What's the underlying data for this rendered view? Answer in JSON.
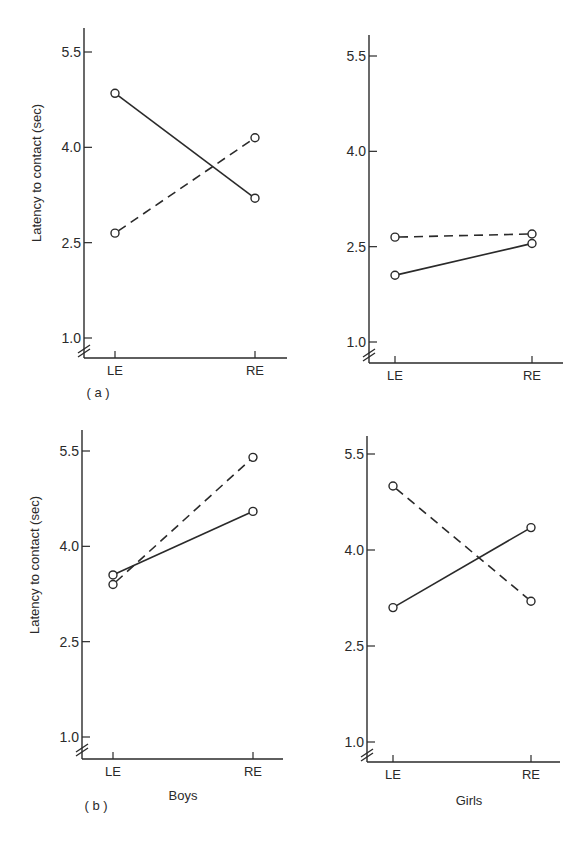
{
  "figure": {
    "panel_labels": {
      "a": "( a )",
      "b": "( b )"
    },
    "y_axis_title": "Latency to contact (sec)",
    "group_labels": {
      "boys": "Boys",
      "girls": "Girls"
    },
    "line_color": "#2a2a2a"
  },
  "chart_data": [
    {
      "id": "a-boys",
      "type": "line",
      "row": "a",
      "column": "Boys",
      "categories": [
        "LE",
        "RE"
      ],
      "yticks": [
        "1.0",
        "2.5",
        "4.0",
        "5.5"
      ],
      "ylim": [
        1.0,
        5.5
      ],
      "y_axis_break": true,
      "ylabel": "Latency to contact (sec)",
      "xlabel": "",
      "series": [
        {
          "name": "solid",
          "style": "solid",
          "marker": "open-circle",
          "values": [
            4.85,
            3.2
          ]
        },
        {
          "name": "dashed",
          "style": "dashed",
          "marker": "open-circle",
          "values": [
            2.65,
            4.15
          ]
        }
      ]
    },
    {
      "id": "a-girls",
      "type": "line",
      "row": "a",
      "column": "Girls",
      "categories": [
        "LE",
        "RE"
      ],
      "yticks": [
        "1.0",
        "2.5",
        "4.0",
        "5.5"
      ],
      "ylim": [
        1.0,
        5.5
      ],
      "y_axis_break": true,
      "ylabel": "",
      "xlabel": "",
      "series": [
        {
          "name": "solid",
          "style": "solid",
          "marker": "open-circle",
          "values": [
            2.05,
            2.55
          ]
        },
        {
          "name": "dashed",
          "style": "dashed",
          "marker": "open-circle",
          "values": [
            2.65,
            2.7
          ]
        }
      ]
    },
    {
      "id": "b-boys",
      "type": "line",
      "row": "b",
      "column": "Boys",
      "categories": [
        "LE",
        "RE"
      ],
      "yticks": [
        "1.0",
        "2.5",
        "4.0",
        "5.5"
      ],
      "ylim": [
        1.0,
        5.5
      ],
      "y_axis_break": true,
      "ylabel": "Latency to contact (sec)",
      "xlabel": "Boys",
      "series": [
        {
          "name": "solid",
          "style": "solid",
          "marker": "open-circle",
          "values": [
            3.55,
            4.55
          ]
        },
        {
          "name": "dashed",
          "style": "dashed",
          "marker": "open-circle",
          "values": [
            3.4,
            5.4
          ]
        }
      ]
    },
    {
      "id": "b-girls",
      "type": "line",
      "row": "b",
      "column": "Girls",
      "categories": [
        "LE",
        "RE"
      ],
      "yticks": [
        "1.0",
        "2.5",
        "4.0",
        "5.5"
      ],
      "ylim": [
        1.0,
        5.5
      ],
      "y_axis_break": true,
      "ylabel": "",
      "xlabel": "Girls",
      "series": [
        {
          "name": "solid",
          "style": "solid",
          "marker": "open-circle",
          "values": [
            3.1,
            4.35
          ]
        },
        {
          "name": "dashed",
          "style": "dashed",
          "marker": "open-circle",
          "values": [
            5.0,
            3.2
          ]
        }
      ]
    }
  ]
}
